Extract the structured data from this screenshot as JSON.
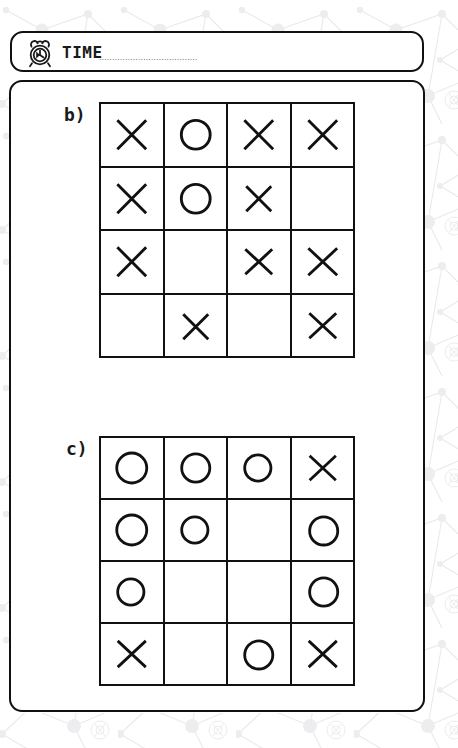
{
  "page": {
    "background_pattern": "molecule-network-pattern",
    "ink_color": "#111111",
    "paper_color": "#ffffff"
  },
  "time_bar": {
    "icon": "alarm-clock-icon",
    "label": "TIME",
    "value": "",
    "placeholder": "",
    "line_style": "dotted"
  },
  "puzzles": [
    {
      "label": "b)",
      "rows": 4,
      "cols": 4,
      "cells": [
        [
          "X",
          "O",
          "X",
          "X"
        ],
        [
          "X",
          "O",
          "X",
          ""
        ],
        [
          "X",
          "",
          "X",
          "X"
        ],
        [
          "",
          "X",
          "",
          "X"
        ]
      ]
    },
    {
      "label": "c)",
      "rows": 4,
      "cols": 4,
      "cells": [
        [
          "O",
          "O",
          "O",
          "X"
        ],
        [
          "O",
          "O",
          "",
          "O"
        ],
        [
          "O",
          "",
          "",
          "O"
        ],
        [
          "X",
          "",
          "O",
          "X"
        ]
      ]
    }
  ],
  "glyphs": {
    "X": "cross-mark",
    "O": "circle-mark",
    "": "empty-cell"
  }
}
